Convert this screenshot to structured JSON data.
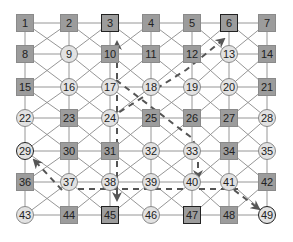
{
  "diagram": {
    "type": "grid-graph",
    "rows": 7,
    "cols": 7,
    "col_x": [
      25,
      69,
      110,
      151,
      192,
      229,
      267
    ],
    "row_y": [
      23,
      54,
      87,
      118,
      151,
      182,
      215
    ],
    "colors": {
      "square_fill": "#9c9c9c",
      "circle_fill": "#e2e2e2",
      "edge": "#8a8a8a",
      "path": "#555555",
      "highlight_border": "#222222"
    },
    "nodes": [
      {
        "id": 1,
        "shape": "square",
        "highlight": false
      },
      {
        "id": 2,
        "shape": "square",
        "highlight": false
      },
      {
        "id": 3,
        "shape": "square",
        "highlight": true
      },
      {
        "id": 4,
        "shape": "square",
        "highlight": false
      },
      {
        "id": 5,
        "shape": "square",
        "highlight": false
      },
      {
        "id": 6,
        "shape": "square",
        "highlight": true
      },
      {
        "id": 7,
        "shape": "square",
        "highlight": false
      },
      {
        "id": 8,
        "shape": "square",
        "highlight": false
      },
      {
        "id": 9,
        "shape": "circle",
        "highlight": false
      },
      {
        "id": 10,
        "shape": "square",
        "highlight": false
      },
      {
        "id": 11,
        "shape": "square",
        "highlight": false
      },
      {
        "id": 12,
        "shape": "square",
        "highlight": false
      },
      {
        "id": 13,
        "shape": "circle",
        "highlight": false
      },
      {
        "id": 14,
        "shape": "square",
        "highlight": false
      },
      {
        "id": 15,
        "shape": "square",
        "highlight": false
      },
      {
        "id": 16,
        "shape": "circle",
        "highlight": false
      },
      {
        "id": 17,
        "shape": "circle",
        "highlight": false
      },
      {
        "id": 18,
        "shape": "circle",
        "highlight": false
      },
      {
        "id": 19,
        "shape": "circle",
        "highlight": false
      },
      {
        "id": 20,
        "shape": "circle",
        "highlight": false
      },
      {
        "id": 21,
        "shape": "square",
        "highlight": false
      },
      {
        "id": 22,
        "shape": "circle",
        "highlight": false
      },
      {
        "id": 23,
        "shape": "square",
        "highlight": false
      },
      {
        "id": 24,
        "shape": "circle",
        "highlight": false
      },
      {
        "id": 25,
        "shape": "square",
        "highlight": false
      },
      {
        "id": 26,
        "shape": "square",
        "highlight": false
      },
      {
        "id": 27,
        "shape": "square",
        "highlight": false
      },
      {
        "id": 28,
        "shape": "circle",
        "highlight": false
      },
      {
        "id": 29,
        "shape": "circle",
        "highlight": true
      },
      {
        "id": 30,
        "shape": "square",
        "highlight": false
      },
      {
        "id": 31,
        "shape": "square",
        "highlight": false
      },
      {
        "id": 32,
        "shape": "circle",
        "highlight": false
      },
      {
        "id": 33,
        "shape": "circle",
        "highlight": false
      },
      {
        "id": 34,
        "shape": "square",
        "highlight": false
      },
      {
        "id": 35,
        "shape": "circle",
        "highlight": false
      },
      {
        "id": 36,
        "shape": "square",
        "highlight": false
      },
      {
        "id": 37,
        "shape": "circle",
        "highlight": false
      },
      {
        "id": 38,
        "shape": "circle",
        "highlight": false
      },
      {
        "id": 39,
        "shape": "circle",
        "highlight": false
      },
      {
        "id": 40,
        "shape": "circle",
        "highlight": false
      },
      {
        "id": 41,
        "shape": "circle",
        "highlight": false
      },
      {
        "id": 42,
        "shape": "square",
        "highlight": false
      },
      {
        "id": 43,
        "shape": "circle",
        "highlight": false
      },
      {
        "id": 44,
        "shape": "square",
        "highlight": false
      },
      {
        "id": 45,
        "shape": "square",
        "highlight": true
      },
      {
        "id": 46,
        "shape": "circle",
        "highlight": false
      },
      {
        "id": 47,
        "shape": "square",
        "highlight": true
      },
      {
        "id": 48,
        "shape": "square",
        "highlight": false
      },
      {
        "id": 49,
        "shape": "circle",
        "highlight": true
      }
    ],
    "dashed_paths": [
      {
        "name": "path-to-3",
        "points": [
          [
            117,
            200
          ],
          [
            117,
            42
          ]
        ],
        "arrow_end": true
      },
      {
        "name": "path-to-6",
        "points": [
          [
            110,
            118
          ],
          [
            186,
            70
          ],
          [
            224,
            39
          ]
        ],
        "arrow_end": true
      },
      {
        "name": "path-to-47",
        "points": [
          [
            116,
            80
          ],
          [
            192,
            138
          ],
          [
            198,
            151
          ],
          [
            198,
            178
          ]
        ],
        "arrow_end": true
      },
      {
        "name": "horizontal-connector",
        "points": [
          [
            78,
            189
          ],
          [
            238,
            189
          ]
        ],
        "arrow_end": false
      },
      {
        "name": "path-to-45",
        "points": [
          [
            117,
            189
          ],
          [
            117,
            200
          ]
        ],
        "arrow_end": true
      },
      {
        "name": "path-to-29",
        "points": [
          [
            62,
            190
          ],
          [
            34,
            160
          ]
        ],
        "arrow_end": true
      },
      {
        "name": "path-to-49",
        "points": [
          [
            234,
            190
          ],
          [
            259,
            209
          ]
        ],
        "arrow_end": true
      }
    ]
  }
}
